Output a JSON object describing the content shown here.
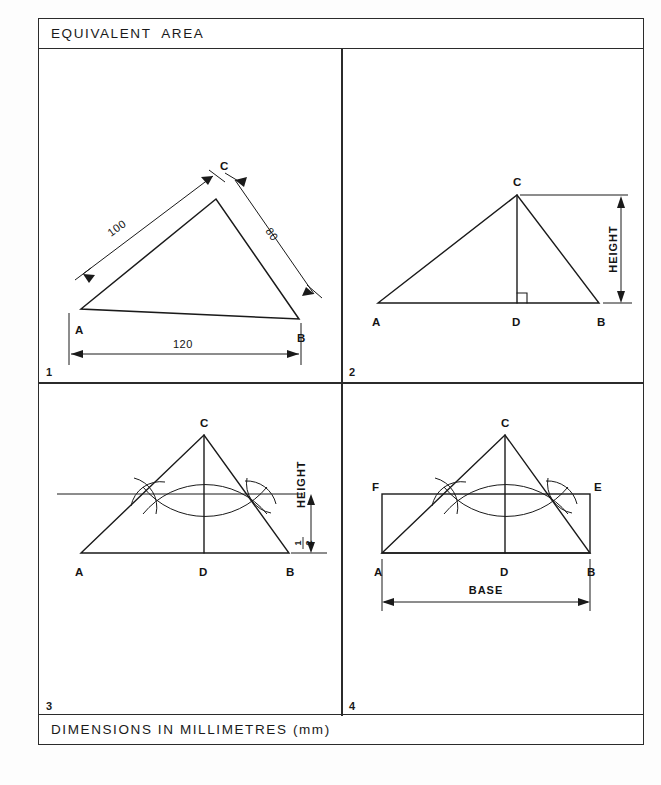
{
  "sheet": {
    "title": "EQUIVALENT  AREA",
    "footer": "DIMENSIONS IN MILLIMETRES (mm)"
  },
  "quadrants": [
    {
      "number": "1",
      "name": "triangle-given-dimensions",
      "vertex_labels": [
        "A",
        "B",
        "C"
      ],
      "dimensions": [
        {
          "label": "100",
          "side": "AC"
        },
        {
          "label": "80",
          "side": "CB"
        },
        {
          "label": "120",
          "side": "AB"
        }
      ]
    },
    {
      "number": "2",
      "name": "triangle-height-construction",
      "vertex_labels": [
        "A",
        "B",
        "C",
        "D"
      ],
      "dimensions": [
        {
          "label": "HEIGHT",
          "side": "CD"
        }
      ]
    },
    {
      "number": "3",
      "name": "half-height-bisector-construction",
      "vertex_labels": [
        "A",
        "B",
        "C",
        "D"
      ],
      "dimensions": [
        {
          "label": "HEIGHT",
          "numerator": "1",
          "denominator": "2",
          "side": "half-height"
        }
      ]
    },
    {
      "number": "4",
      "name": "equivalent-rectangle",
      "vertex_labels": [
        "A",
        "B",
        "C",
        "D",
        "E",
        "F"
      ],
      "dimensions": [
        {
          "label": "BASE",
          "side": "AB"
        }
      ]
    }
  ],
  "colors": {
    "ink": "#1a1a1a",
    "line": "#2b2b2b",
    "paper": "#ffffff"
  }
}
